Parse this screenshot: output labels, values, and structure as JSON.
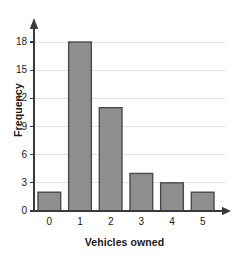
{
  "chart_data": {
    "type": "bar",
    "title": "",
    "subtitle": "",
    "xlabel": "Vehicles owned",
    "ylabel": "Frequency",
    "categories": [
      "0",
      "1",
      "2",
      "3",
      "4",
      "5"
    ],
    "values": [
      2,
      18,
      11,
      4,
      3,
      2
    ],
    "series": [
      {
        "name": "Frequency",
        "values": [
          2,
          18,
          11,
          4,
          3,
          2
        ]
      }
    ],
    "ylim": [
      0,
      18
    ],
    "xlim": [
      -0.5,
      5.5
    ],
    "y_ticks": [
      0,
      3,
      6,
      9,
      12,
      15,
      18
    ],
    "y_tick_labels": [
      "0",
      "3",
      "6",
      "9",
      "12",
      "15",
      "18"
    ],
    "x_tick_labels": [
      "0",
      "1",
      "2",
      "3",
      "4",
      "5"
    ],
    "grid": "horizontal",
    "legend": "none",
    "annotations": [],
    "colors": {
      "bar_fill": "#8f8f8f",
      "bar_border": "#4a4a4a",
      "gridline": "#e2e2e2",
      "axis": "#3a3a3a",
      "text": "#1a1a1a",
      "background": "#ffffff"
    },
    "axis_style": {
      "y_axis_arrow": "up",
      "x_axis_arrow": "right"
    }
  }
}
